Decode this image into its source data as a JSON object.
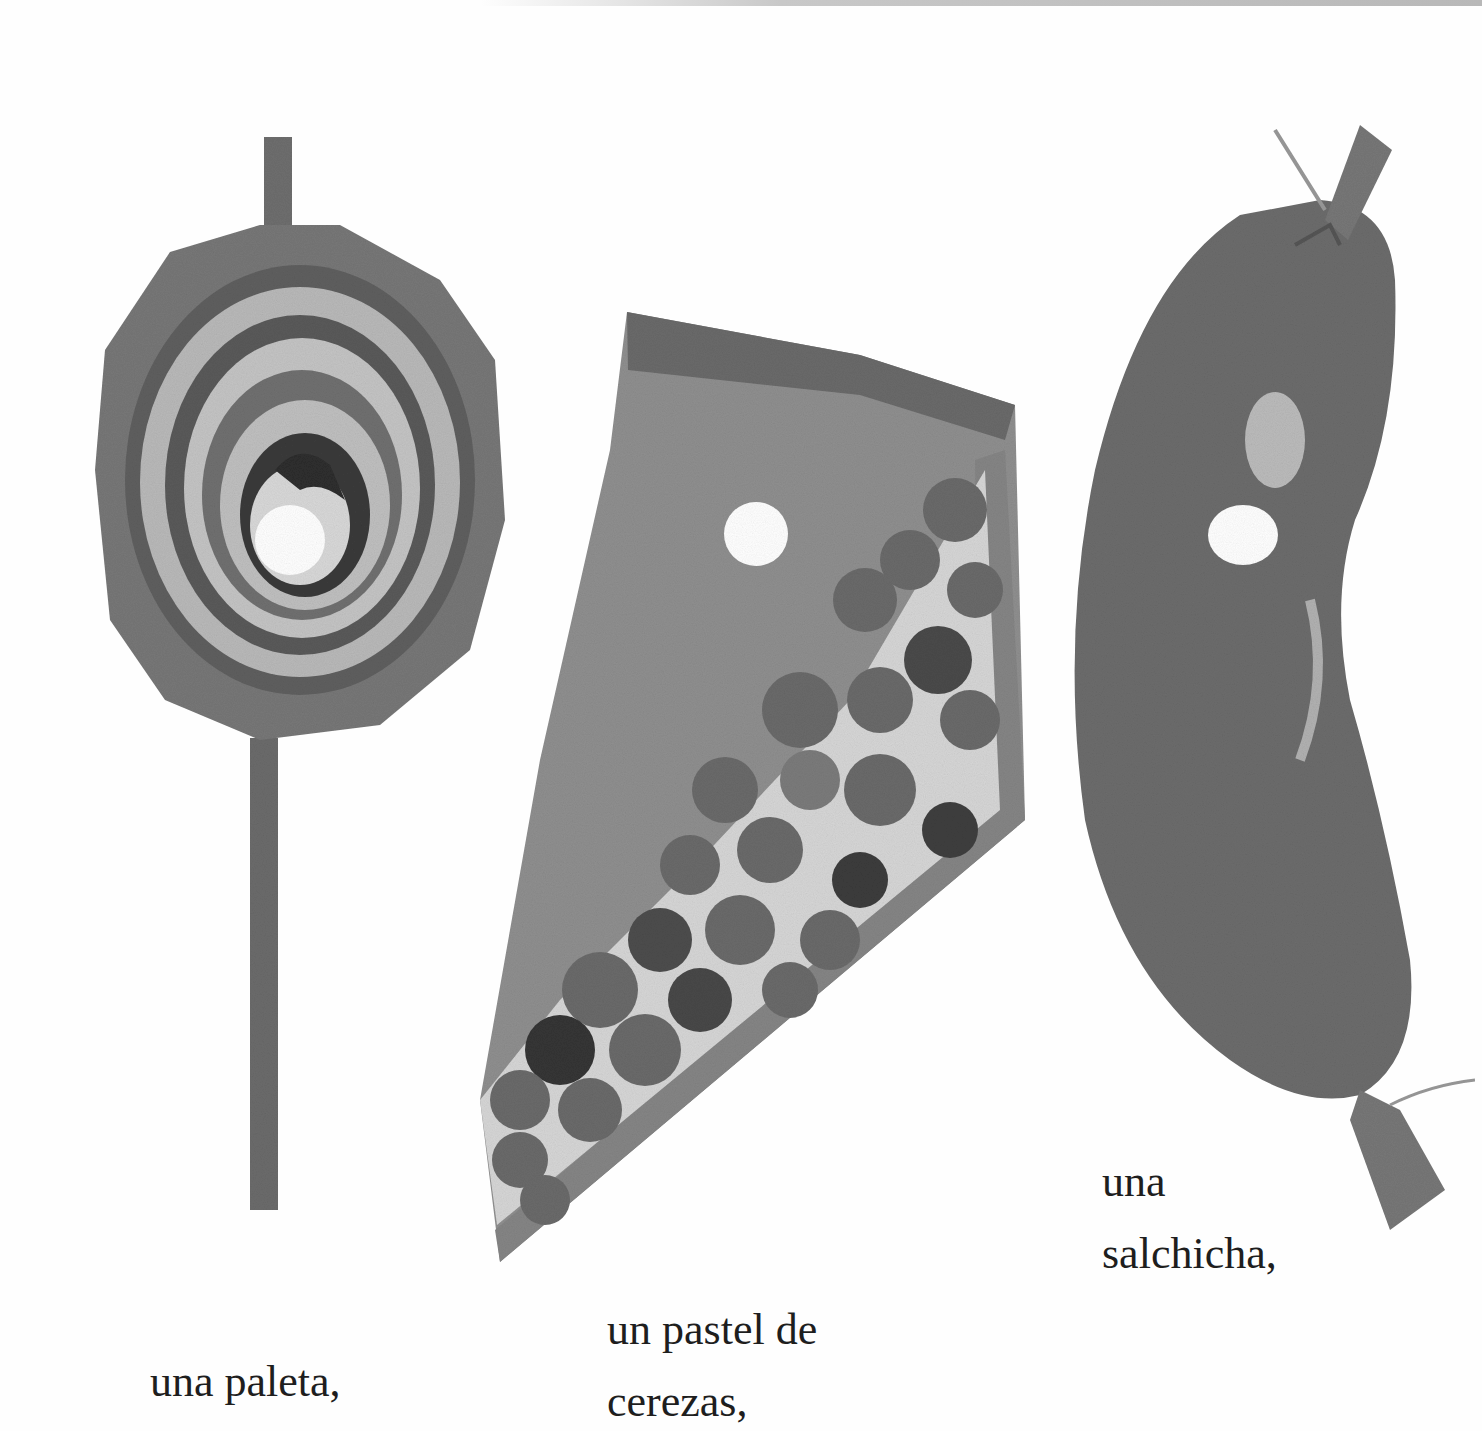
{
  "page": {
    "background": "#fefefe",
    "items": [
      {
        "name": "lollipop",
        "caption_lines": [
          "una paleta,"
        ],
        "color": "#6f6f6f"
      },
      {
        "name": "cherry-pie",
        "caption_lines": [
          "un pastel de",
          "cerezas,"
        ],
        "color": "#7a7a7a"
      },
      {
        "name": "sausage",
        "caption_lines": [
          "una",
          "salchicha,"
        ],
        "color": "#707070"
      }
    ]
  }
}
